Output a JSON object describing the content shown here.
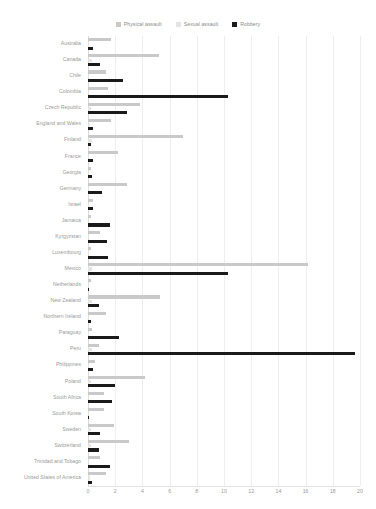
{
  "legend": {
    "position": "top-center",
    "items": [
      {
        "label": "Physical assault",
        "color": "#c9c9c9",
        "key": "physical"
      },
      {
        "label": "Sexual assault",
        "color": "#e4e4e4",
        "key": "sexual"
      },
      {
        "label": "Robbery",
        "color": "#1a1a1a",
        "key": "robbery"
      }
    ]
  },
  "chart_data": {
    "type": "bar",
    "orientation": "horizontal",
    "title": "",
    "subtitle": "",
    "xlabel": "",
    "ylabel": "",
    "xlim": [
      0,
      20
    ],
    "xticks": [
      0,
      2,
      4,
      6,
      8,
      10,
      12,
      14,
      16,
      18,
      20
    ],
    "xtick_labels": [
      "0",
      "2",
      "4",
      "6",
      "8",
      "10",
      "12",
      "14",
      "16",
      "18",
      "20"
    ],
    "grid": true,
    "grid_axis": "x",
    "legend_position": "top-center",
    "categories": [
      "Australia",
      "Canada",
      "Chile",
      "Colombia",
      "Czech Republic",
      "England and Wales",
      "Finland",
      "France",
      "Georgia",
      "Germany",
      "Israel",
      "Jamaica",
      "Kyrgyzstan",
      "Luxembourg",
      "Mexico",
      "Netherlands",
      "New Zealand",
      "Northern Ireland",
      "Paraguay",
      "Peru",
      "Philippines",
      "Poland",
      "South Africa",
      "South Korea",
      "Sweden",
      "Switzerland",
      "Trinidad and Tobago",
      "United States of America"
    ],
    "series": [
      {
        "name": "Physical assault",
        "color": "#c9c9c9",
        "values": [
          1.7,
          5.2,
          1.3,
          1.5,
          3.8,
          1.7,
          7.0,
          2.2,
          0.2,
          2.9,
          0.4,
          0.2,
          0.9,
          0.2,
          16.2,
          0.2,
          5.3,
          1.3,
          0.3,
          0.8,
          0.5,
          4.2,
          1.2,
          1.2,
          1.9,
          3.0,
          0.9,
          1.3
        ]
      },
      {
        "name": "Sexual assault",
        "color": "#e4e4e4",
        "values": [
          0.1,
          0.3,
          0.05,
          0.05,
          0.2,
          0.15,
          0.3,
          0.1,
          0.05,
          0.1,
          0.05,
          0.05,
          0.1,
          0.05,
          0.3,
          0.05,
          0.3,
          0.1,
          0.05,
          0.3,
          0.05,
          0.2,
          0.1,
          0.1,
          0.2,
          0.2,
          0.1,
          0.15
        ]
      },
      {
        "name": "Robbery",
        "color": "#1a1a1a",
        "values": [
          0.4,
          0.9,
          2.6,
          10.3,
          2.9,
          0.4,
          0.2,
          0.4,
          0.3,
          1.0,
          0.4,
          1.6,
          1.4,
          1.5,
          10.3,
          0.1,
          0.8,
          0.2,
          2.3,
          19.6,
          0.4,
          2.0,
          1.8,
          0.05,
          0.9,
          0.8,
          1.6,
          0.3
        ]
      }
    ]
  }
}
